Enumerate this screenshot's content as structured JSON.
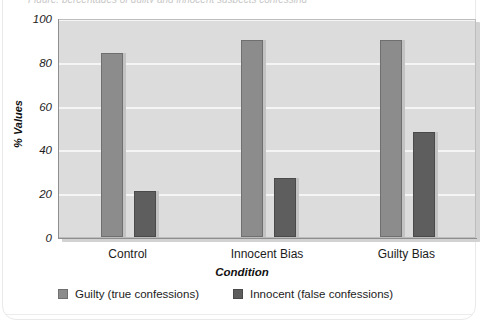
{
  "figure": {
    "caption_fragment": "Figure: percentages of guilty and innocent suspects confessing"
  },
  "chart_data": {
    "type": "bar",
    "title": "",
    "xlabel": "Condition",
    "ylabel": "% Values",
    "categories": [
      "Control",
      "Innocent Bias",
      "Guilty Bias"
    ],
    "series": [
      {
        "name": "Guilty (true confessions)",
        "color": "#8c8c8c",
        "values": [
          84,
          90,
          90
        ]
      },
      {
        "name": "Innocent (false confessions)",
        "color": "#5e5e5e",
        "values": [
          21,
          27,
          48
        ]
      }
    ],
    "ylim": [
      0,
      100
    ],
    "yticks": [
      0,
      20,
      40,
      60,
      80,
      100
    ],
    "ytick_labels": [
      "0",
      "20",
      "40",
      "60",
      "80",
      "100"
    ],
    "grid": true,
    "grid_color": "#f5f5f5",
    "plot_background": "#dcdcdc",
    "legend_position": "bottom-left"
  }
}
